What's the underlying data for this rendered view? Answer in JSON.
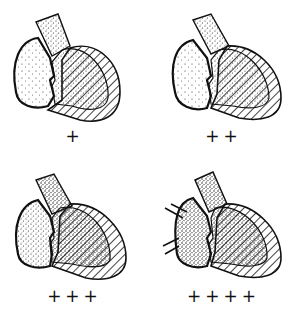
{
  "figure": {
    "panels": [
      {
        "grade": "+",
        "atrium_density": 0.15,
        "ventricle_density": 0.45
      },
      {
        "grade": "++",
        "atrium_density": 0.3,
        "ventricle_density": 0.55
      },
      {
        "grade": "+++",
        "atrium_density": 0.55,
        "ventricle_density": 0.7
      },
      {
        "grade": "++++",
        "atrium_density": 0.75,
        "ventricle_density": 0.8
      }
    ]
  },
  "colors": {
    "ink": "#111111",
    "background": "#ffffff"
  }
}
